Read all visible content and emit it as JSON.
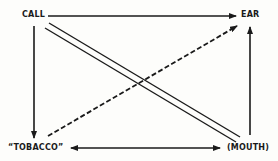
{
  "diagram": {
    "nodes": {
      "call": "CALL",
      "ear": "EAR",
      "tobacco": "“TOBACCO”",
      "mouth": "(MOUTH)"
    },
    "edges": [
      {
        "from": "CALL",
        "to": "EAR",
        "style": "solid",
        "arrow": "end"
      },
      {
        "from": "CALL",
        "to": "“TOBACCO”",
        "style": "solid",
        "arrow": "end"
      },
      {
        "from": "(MOUTH)",
        "to": "EAR",
        "style": "solid",
        "arrow": "end"
      },
      {
        "from": "“TOBACCO”",
        "to": "(MOUTH)",
        "style": "solid",
        "arrow": "both"
      },
      {
        "from": "CALL",
        "to": "(MOUTH)",
        "style": "double",
        "arrow": "none"
      },
      {
        "from": "“TOBACCO”",
        "to": "EAR",
        "style": "dashed",
        "arrow": "end"
      }
    ],
    "colors": {
      "ink": "#1a1a1a",
      "background": "#fdfdfb"
    }
  }
}
